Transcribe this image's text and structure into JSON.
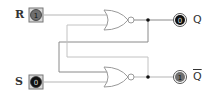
{
  "diagram": {
    "inputs": [
      {
        "id": "R",
        "label": "R",
        "value": "1",
        "fill": "#6f6f6f"
      },
      {
        "id": "S",
        "label": "S",
        "value": "0",
        "fill": "#111111"
      }
    ],
    "outputs": [
      {
        "id": "Q",
        "label": "Q",
        "value": "0",
        "fill": "#111111"
      },
      {
        "id": "Qbar",
        "label": "Q",
        "overbar": true,
        "value": "1",
        "fill": "#6f6f6f"
      }
    ],
    "gates": [
      {
        "id": "nor-top",
        "type": "NOR",
        "inputs": [
          "R",
          "Qbar"
        ],
        "output": "Q"
      },
      {
        "id": "nor-bottom",
        "type": "NOR",
        "inputs": [
          "Q",
          "S"
        ],
        "output": "Qbar"
      }
    ],
    "colors": {
      "wire": "#b5b5b5",
      "wire_dark": "#8a8a8a",
      "gate_stroke": "#9a9a9a",
      "node": "#111111"
    }
  }
}
